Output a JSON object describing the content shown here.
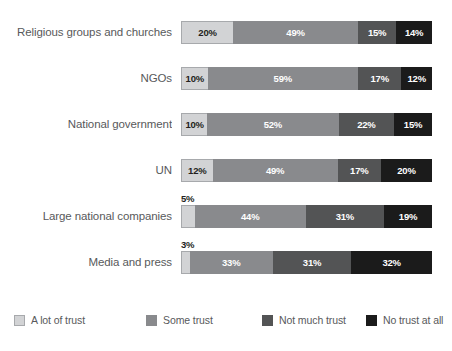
{
  "chart_data": {
    "type": "bar",
    "subtype": "horizontal-100-percent-stacked",
    "title": "",
    "subtitle": "",
    "xlabel": "",
    "ylabel": "",
    "xlim": [
      0,
      100
    ],
    "grid": false,
    "legend_position": "bottom",
    "value_suffix": "%",
    "categories": [
      "Religious groups and churches",
      "NGOs",
      "National government",
      "UN",
      "Large national companies",
      "Media and press"
    ],
    "series": [
      {
        "name": "A lot of trust",
        "color": "#d2d3d5",
        "values": [
          20,
          10,
          10,
          12,
          5,
          3
        ]
      },
      {
        "name": "Some trust",
        "color": "#898a8d",
        "values": [
          49,
          59,
          52,
          49,
          44,
          33
        ]
      },
      {
        "name": "Not much trust",
        "color": "#535455",
        "values": [
          15,
          17,
          22,
          17,
          31,
          31
        ]
      },
      {
        "name": "No trust at all",
        "color": "#1b1b1b",
        "values": [
          14,
          12,
          15,
          20,
          19,
          32
        ]
      }
    ],
    "rows": [
      {
        "label": "Religious groups and churches",
        "segments": [
          {
            "series": "A lot of trust",
            "value": 20,
            "label": "20%",
            "label_position": "inside"
          },
          {
            "series": "Some trust",
            "value": 49,
            "label": "49%",
            "label_position": "inside"
          },
          {
            "series": "Not much trust",
            "value": 15,
            "label": "15%",
            "label_position": "inside"
          },
          {
            "series": "No trust at all",
            "value": 14,
            "label": "14%",
            "label_position": "inside"
          }
        ],
        "callout": ""
      },
      {
        "label": "NGOs",
        "segments": [
          {
            "series": "A lot of trust",
            "value": 10,
            "label": "10%",
            "label_position": "inside"
          },
          {
            "series": "Some trust",
            "value": 59,
            "label": "59%",
            "label_position": "inside"
          },
          {
            "series": "Not much trust",
            "value": 17,
            "label": "17%",
            "label_position": "inside"
          },
          {
            "series": "No trust at all",
            "value": 12,
            "label": "12%",
            "label_position": "inside"
          }
        ],
        "callout": ""
      },
      {
        "label": "National government",
        "segments": [
          {
            "series": "A lot of trust",
            "value": 10,
            "label": "10%",
            "label_position": "inside"
          },
          {
            "series": "Some trust",
            "value": 52,
            "label": "52%",
            "label_position": "inside"
          },
          {
            "series": "Not much trust",
            "value": 22,
            "label": "22%",
            "label_position": "inside"
          },
          {
            "series": "No trust at all",
            "value": 15,
            "label": "15%",
            "label_position": "inside"
          }
        ],
        "callout": ""
      },
      {
        "label": "UN",
        "segments": [
          {
            "series": "A lot of trust",
            "value": 12,
            "label": "12%",
            "label_position": "inside"
          },
          {
            "series": "Some trust",
            "value": 49,
            "label": "49%",
            "label_position": "inside"
          },
          {
            "series": "Not much trust",
            "value": 17,
            "label": "17%",
            "label_position": "inside"
          },
          {
            "series": "No trust at all",
            "value": 20,
            "label": "20%",
            "label_position": "inside"
          }
        ],
        "callout": ""
      },
      {
        "label": "Large national companies",
        "segments": [
          {
            "series": "A lot of trust",
            "value": 5,
            "label": "5%",
            "label_position": "above"
          },
          {
            "series": "Some trust",
            "value": 44,
            "label": "44%",
            "label_position": "inside"
          },
          {
            "series": "Not much trust",
            "value": 31,
            "label": "31%",
            "label_position": "inside"
          },
          {
            "series": "No trust at all",
            "value": 19,
            "label": "19%",
            "label_position": "inside"
          }
        ],
        "callout": "5%"
      },
      {
        "label": "Media and press",
        "segments": [
          {
            "series": "A lot of trust",
            "value": 3,
            "label": "3%",
            "label_position": "above"
          },
          {
            "series": "Some trust",
            "value": 33,
            "label": "33%",
            "label_position": "inside"
          },
          {
            "series": "Not much trust",
            "value": 31,
            "label": "31%",
            "label_position": "inside"
          },
          {
            "series": "No trust at all",
            "value": 32,
            "label": "32%",
            "label_position": "inside"
          }
        ],
        "callout": "3%"
      }
    ],
    "legend": [
      {
        "label": "A lot of trust",
        "color": "#d2d3d5"
      },
      {
        "label": "Some trust",
        "color": "#898a8d"
      },
      {
        "label": "Not much trust",
        "color": "#535455"
      },
      {
        "label": "No trust at all",
        "color": "#1b1b1b"
      }
    ]
  },
  "layout": {
    "bar_left": 181,
    "bar_width": 251,
    "bar_height": 23,
    "row_pitch": 46,
    "first_row_top": 21,
    "label_width": 172,
    "legend_top": 313,
    "legend_item_x": [
      14,
      146,
      262,
      366
    ]
  }
}
